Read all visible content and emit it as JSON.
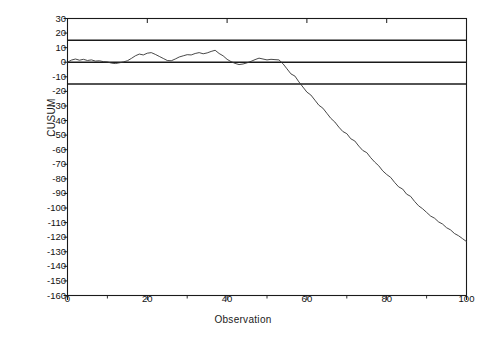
{
  "chart_data": {
    "type": "line",
    "title": "",
    "xlabel": "Observation",
    "ylabel": "CUSUM",
    "xlim": [
      0,
      100
    ],
    "ylim": [
      -160,
      30
    ],
    "grid": false,
    "legend": null,
    "xticks": [
      0,
      20,
      40,
      60,
      80,
      100
    ],
    "xtick_labels": [
      "0",
      "20",
      "40",
      "60",
      "80",
      "100"
    ],
    "xminor_ticks": [
      10,
      30,
      50,
      70,
      90
    ],
    "yticks": [
      30,
      20,
      10,
      0,
      -10,
      -20,
      -30,
      -40,
      -50,
      -60,
      -70,
      -80,
      -90,
      -100,
      -110,
      -120,
      -130,
      -140,
      -150,
      -160
    ],
    "ytick_labels": [
      "30",
      "20",
      "10",
      "0",
      "-10",
      "-20",
      "-30",
      "-40",
      "-50",
      "-60",
      "-70",
      "-80",
      "-90",
      "-100",
      "-110",
      "-120",
      "-130",
      "-140",
      "-150",
      "-160"
    ],
    "reference_lines": [
      {
        "name": "upper-decision-limit",
        "value": 15,
        "color": "#1a1a1a"
      },
      {
        "name": "center-line",
        "value": 0,
        "color": "#1a1a1a"
      },
      {
        "name": "lower-decision-limit",
        "value": -15,
        "color": "#1a1a1a"
      }
    ],
    "series": [
      {
        "name": "CUSUM",
        "color": "#333333",
        "x": [
          0,
          1,
          2,
          3,
          4,
          5,
          6,
          7,
          8,
          9,
          10,
          11,
          12,
          13,
          14,
          15,
          16,
          17,
          18,
          19,
          20,
          21,
          22,
          23,
          24,
          25,
          26,
          27,
          28,
          29,
          30,
          31,
          32,
          33,
          34,
          35,
          36,
          37,
          38,
          39,
          40,
          41,
          42,
          43,
          44,
          45,
          46,
          47,
          48,
          49,
          50,
          51,
          52,
          53,
          54,
          55,
          56,
          57,
          58,
          59,
          60,
          61,
          62,
          63,
          64,
          65,
          66,
          67,
          68,
          69,
          70,
          71,
          72,
          73,
          74,
          75,
          76,
          77,
          78,
          79,
          80,
          81,
          82,
          83,
          84,
          85,
          86,
          87,
          88,
          89,
          90,
          91,
          92,
          93,
          94,
          95,
          96,
          97,
          98,
          99,
          100
        ],
        "values": [
          0,
          1.5,
          2.2,
          1.4,
          2.0,
          1.2,
          1.6,
          0.8,
          1.0,
          0.4,
          0.2,
          -0.6,
          -0.9,
          -0.4,
          0.2,
          1.0,
          2.6,
          4.4,
          5.6,
          5.0,
          6.2,
          6.6,
          5.4,
          4.0,
          2.6,
          1.2,
          1.0,
          2.2,
          3.6,
          4.4,
          5.2,
          5.0,
          6.0,
          6.6,
          5.8,
          6.4,
          7.4,
          8.2,
          6.0,
          4.4,
          2.0,
          0.4,
          -0.8,
          -1.6,
          -1.2,
          -0.4,
          0.6,
          1.8,
          2.8,
          2.2,
          1.6,
          2.0,
          1.8,
          1.6,
          -1.0,
          -4.5,
          -8.0,
          -9.5,
          -13.5,
          -17.0,
          -20.5,
          -22.5,
          -26.0,
          -29.5,
          -31.5,
          -35.0,
          -38.5,
          -41.0,
          -44.5,
          -47.5,
          -49.0,
          -52.5,
          -54.0,
          -57.5,
          -60.5,
          -62.0,
          -65.5,
          -68.5,
          -71.0,
          -74.5,
          -77.0,
          -79.0,
          -82.5,
          -85.5,
          -87.0,
          -90.5,
          -92.0,
          -95.5,
          -98.5,
          -100.5,
          -103.0,
          -105.5,
          -107.0,
          -109.5,
          -111.0,
          -113.5,
          -115.0,
          -117.5,
          -119.0,
          -121.0,
          -123.0
        ]
      }
    ]
  },
  "axes": {
    "y_title": "CUSUM",
    "x_title": "Observation"
  }
}
